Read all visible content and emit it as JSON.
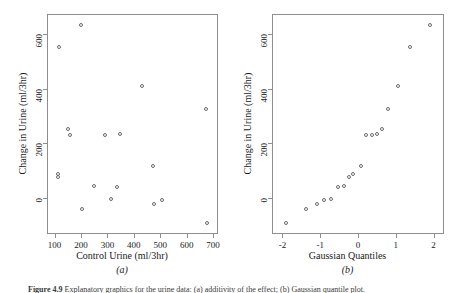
{
  "figure": {
    "caption_label": "Figure 4.9",
    "caption_text": "Explanatory graphics for the urine data: (a) additivity of the effect; (b) Gaussian quantile plot.",
    "panel_a_label": "(a)",
    "panel_b_label": "(b)"
  },
  "style": {
    "frame_color": "#8e8e8e",
    "point_color": "#6b6b6b",
    "background": "#ffffff",
    "text_color": "#1a1a1a"
  },
  "chart_data": [
    {
      "type": "scatter",
      "panel": "(a)",
      "title": "",
      "xlabel": "Control Urine (ml/3hr)",
      "ylabel": "Change in Urine (ml/3hr)",
      "xlim": [
        75,
        715
      ],
      "ylim": [
        -130,
        670
      ],
      "xticks": [
        100,
        200,
        300,
        400,
        500,
        600,
        700
      ],
      "xtick_labels": [
        "100",
        "200",
        "300",
        "400",
        "500",
        "600",
        "700"
      ],
      "yticks": [
        0,
        200,
        400,
        600
      ],
      "ytick_labels": [
        "0",
        "200",
        "400",
        "600"
      ],
      "grid": false,
      "legend": "none",
      "marker": "open-circle",
      "n_points": 18,
      "x": [
        112,
        112,
        118,
        152,
        157,
        200,
        203,
        248,
        290,
        313,
        337,
        348,
        430,
        472,
        478,
        505,
        672,
        678
      ],
      "y": [
        74,
        86,
        553,
        252,
        228,
        632,
        -43,
        44,
        228,
        -5,
        37,
        233,
        408,
        116,
        -22,
        -8,
        325,
        -93
      ],
      "points": [
        {
          "x": 112,
          "y": 74
        },
        {
          "x": 112,
          "y": 86
        },
        {
          "x": 118,
          "y": 553
        },
        {
          "x": 152,
          "y": 252
        },
        {
          "x": 157,
          "y": 228
        },
        {
          "x": 200,
          "y": 632
        },
        {
          "x": 203,
          "y": -43
        },
        {
          "x": 248,
          "y": 44
        },
        {
          "x": 290,
          "y": 228
        },
        {
          "x": 313,
          "y": -5
        },
        {
          "x": 337,
          "y": 37
        },
        {
          "x": 348,
          "y": 233
        },
        {
          "x": 430,
          "y": 408
        },
        {
          "x": 472,
          "y": 116
        },
        {
          "x": 478,
          "y": -22
        },
        {
          "x": 505,
          "y": -8
        },
        {
          "x": 672,
          "y": 325
        },
        {
          "x": 678,
          "y": -93
        }
      ]
    },
    {
      "type": "scatter",
      "panel": "(b)",
      "title": "",
      "xlabel": "Gaussian Quantiles",
      "ylabel": "Change in Urine (ml/3hr)",
      "xlim": [
        -2.25,
        2.25
      ],
      "ylim": [
        -130,
        670
      ],
      "xticks": [
        -2,
        -1,
        0,
        1,
        2
      ],
      "xtick_labels": [
        "-2",
        "-1",
        "0",
        "1",
        "2"
      ],
      "yticks": [
        0,
        200,
        400,
        600
      ],
      "ytick_labels": [
        "0",
        "200",
        "400",
        "600"
      ],
      "grid": false,
      "legend": "none",
      "marker": "open-circle",
      "n_points": 18,
      "x": [
        -1.91,
        -1.38,
        -1.09,
        -0.89,
        -0.71,
        -0.54,
        -0.38,
        -0.25,
        -0.12,
        0.09,
        0.21,
        0.36,
        0.5,
        0.64,
        0.8,
        1.06,
        1.37,
        1.91
      ],
      "y": [
        -93,
        -43,
        -22,
        -8,
        -5,
        37,
        44,
        74,
        86,
        116,
        228,
        228,
        233,
        252,
        325,
        408,
        553,
        632
      ],
      "points": [
        {
          "x": -1.91,
          "y": -93
        },
        {
          "x": -1.38,
          "y": -43
        },
        {
          "x": -1.09,
          "y": -22
        },
        {
          "x": -0.89,
          "y": -8
        },
        {
          "x": -0.71,
          "y": -5
        },
        {
          "x": -0.54,
          "y": 37
        },
        {
          "x": -0.38,
          "y": 44
        },
        {
          "x": -0.25,
          "y": 74
        },
        {
          "x": -0.12,
          "y": 86
        },
        {
          "x": 0.09,
          "y": 116
        },
        {
          "x": 0.21,
          "y": 228
        },
        {
          "x": 0.36,
          "y": 228
        },
        {
          "x": 0.5,
          "y": 233
        },
        {
          "x": 0.64,
          "y": 252
        },
        {
          "x": 0.8,
          "y": 325
        },
        {
          "x": 1.06,
          "y": 408
        },
        {
          "x": 1.37,
          "y": 553
        },
        {
          "x": 1.91,
          "y": 632
        }
      ]
    }
  ]
}
